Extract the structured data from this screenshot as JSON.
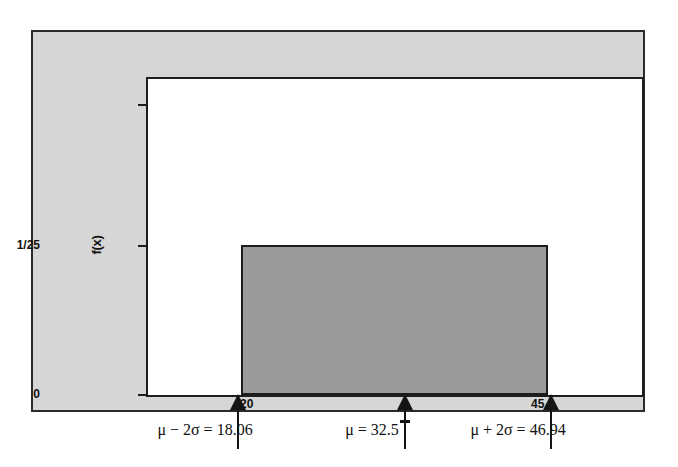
{
  "chart_data": {
    "type": "area",
    "title": "",
    "subtitle": "",
    "xlabel": "",
    "ylabel": "f(x)",
    "grid": false,
    "legend": "none",
    "distribution": "uniform",
    "support": [
      20,
      45
    ],
    "density_value": "1/25",
    "xlim": [
      13.5,
      53.5
    ],
    "ylim": [
      0,
      0.0853
    ],
    "y_tick_labels": [
      "0",
      "1/25"
    ],
    "y_tick_values": [
      0,
      0.04
    ],
    "x_tick_labels": [
      "20",
      "45"
    ],
    "x_tick_values": [
      20,
      45
    ],
    "series": [
      {
        "name": "f(x) = 1/25 on [20,45]",
        "x": [
          20,
          20,
          45,
          45
        ],
        "values": [
          0,
          0.04,
          0.04,
          0
        ],
        "fill_color": "#9a9a9a",
        "line_color": "#1d1d1d"
      }
    ],
    "annotations": [
      {
        "name": "mu-minus-2sigma",
        "x": 18.06,
        "label": "μ − 2σ = 18.06",
        "marker": "up-arrow"
      },
      {
        "name": "mu",
        "x": 32.5,
        "label": "μ = 32.5",
        "marker": "up-arrow-with-tick"
      },
      {
        "name": "mu-plus-2sigma",
        "x": 46.94,
        "label": "μ + 2σ = 46.94",
        "marker": "up-arrow"
      }
    ]
  },
  "axes": {
    "y_title": "f(x)",
    "y_ticks": [
      {
        "name": "top",
        "label": ""
      },
      {
        "name": "density",
        "label": "1/25"
      },
      {
        "name": "origin",
        "label": "0"
      }
    ]
  },
  "plot": {
    "x_labels": {
      "lower_bound": "20",
      "upper_bound": "45"
    },
    "mean_tick_symbol": "x"
  },
  "captions": {
    "lower": "μ − 2σ = 18.06",
    "mean": "μ = 32.5",
    "upper": "μ + 2σ = 46.94"
  },
  "colors": {
    "panel_background": "#d6d6d6",
    "plot_background": "#ffffff",
    "shaded_region": "#9a9a9a",
    "line": "#1d1d1d",
    "text": "#111111"
  }
}
